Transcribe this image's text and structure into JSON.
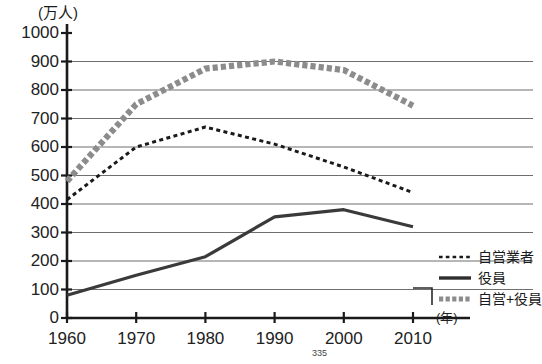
{
  "chart_data": {
    "type": "line",
    "title": "",
    "subtitle": "",
    "unit_label": "(万人)",
    "xlabel": "(年)",
    "ylabel": "",
    "x": [
      1960,
      1970,
      1980,
      1990,
      2000,
      2010
    ],
    "xtick_labels": [
      "1960",
      "1970",
      "1980",
      "1990",
      "2000",
      "2010"
    ],
    "ytick_labels": [
      "0",
      "100",
      "200",
      "300",
      "400",
      "500",
      "600",
      "700",
      "800",
      "900",
      "1000"
    ],
    "ylim": [
      0,
      1000
    ],
    "ytick_step": 100,
    "grid": true,
    "grid_axis": "y",
    "legend_position": "right-bottom",
    "series": [
      {
        "name": "自営業者",
        "style": "dotted",
        "color": "#1a1a1a",
        "values": [
          415,
          600,
          670,
          610,
          530,
          440
        ]
      },
      {
        "name": "役員",
        "style": "solid",
        "color": "#3a3a3a",
        "values": [
          80,
          150,
          215,
          355,
          380,
          320
        ]
      },
      {
        "name": "自営+役員",
        "style": "thick-dashed",
        "color": "#8c8c8c",
        "values": [
          480,
          750,
          875,
          900,
          870,
          745
        ]
      }
    ]
  },
  "axis": {
    "unit_label": "(万人)",
    "x_unit_label": "(年)"
  },
  "legend": {
    "items": [
      {
        "label": "自営業者",
        "swatch": "dotted-line-swatch"
      },
      {
        "label": "役員",
        "swatch": "solid-line-swatch"
      },
      {
        "label": "自営+役員",
        "swatch": "thick-dashed-line-swatch"
      }
    ]
  },
  "footer": {
    "page_number": "335"
  },
  "colors": {
    "axis": "#1a1a1a",
    "grid": "#6f6f6f",
    "series_self_employed": "#1a1a1a",
    "series_executives": "#3a3a3a",
    "series_combined": "#8c8c8c",
    "background": "#ffffff"
  }
}
